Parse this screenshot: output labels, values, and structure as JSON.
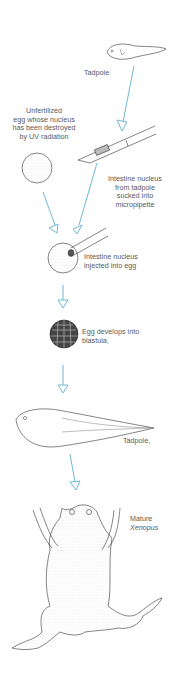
{
  "labels": {
    "tadpole_top": "Tadpole",
    "unfertilized_egg": [
      "Unfertilized",
      "egg whose nucleus",
      "has been destroyed",
      "by UV radiation"
    ],
    "intestine_sucked": [
      "Intestine nucleus",
      "from tadpole",
      "sucked into",
      "micropipette"
    ],
    "intestine_injected": [
      "Intestine nucleus",
      "injected into egg"
    ],
    "blastula": [
      "Egg develops into",
      "blastula,"
    ],
    "tadpole_bottom": "Tadpole,",
    "mature_line1": "Mature",
    "mature_line2": "Xenopus"
  },
  "colors": {
    "arrow": "#6fb8d6",
    "line": "#333333"
  }
}
